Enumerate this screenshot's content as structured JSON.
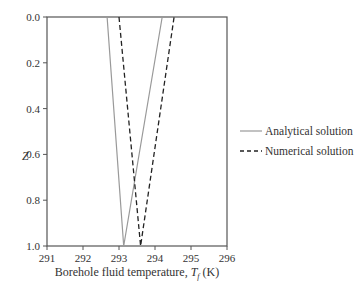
{
  "chart_data": {
    "type": "line",
    "title": "",
    "xlabel": "Borehole fluid temperature, T_f (K)",
    "xlabel_parts": {
      "prefix": "Borehole fluid temperature, ",
      "symbol": "T",
      "subscript": "f",
      "suffix": " (K)"
    },
    "ylabel": "Z",
    "xlim": [
      291,
      296
    ],
    "ylim": [
      1.0,
      0.0
    ],
    "y_inverted": true,
    "grid": false,
    "legend_position": "right-outside",
    "x_ticks": [
      "291",
      "292",
      "293",
      "294",
      "295",
      "296"
    ],
    "y_ticks": [
      "0.0",
      "0.2",
      "0.4",
      "0.6",
      "0.8",
      "1.0"
    ],
    "series": [
      {
        "name": "Analytical solution",
        "style": "solid",
        "color": "#999999",
        "points": [
          [
            292.67,
            0.0
          ],
          [
            293.13,
            1.0
          ],
          [
            294.2,
            0.0
          ]
        ]
      },
      {
        "name": "Numerical solution",
        "style": "dashed",
        "color": "#222222",
        "points": [
          [
            293.0,
            0.0
          ],
          [
            293.6,
            1.0
          ],
          [
            294.53,
            0.0
          ]
        ]
      }
    ]
  }
}
